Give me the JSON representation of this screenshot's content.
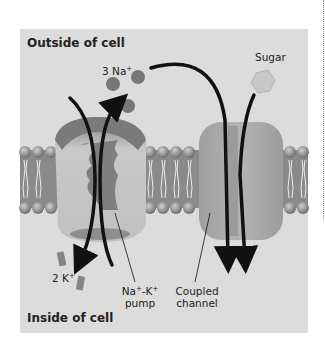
{
  "diagram": {
    "regions": {
      "outside": "Outside of cell",
      "inside": "Inside of cell"
    },
    "ions": {
      "sodium": {
        "count": "3",
        "symbol": "Na",
        "charge": "+"
      },
      "potassium": {
        "count": "2",
        "symbol": "K",
        "charge": "+"
      }
    },
    "molecules": {
      "sugar": "Sugar"
    },
    "proteins": {
      "pump": {
        "line1_a": "Na",
        "line1_charge_a": "+",
        "line1_sep": "-K",
        "line1_charge_b": "+",
        "line2": "pump"
      },
      "channel": {
        "line1": "Coupled",
        "line2": "channel"
      }
    },
    "colors": {
      "background": "#dcdcdc",
      "membrane": "#8c8c8c",
      "pump": "#b5b5b5",
      "channel": "#a9a9a9",
      "ion": "#7a7a7a",
      "arrow": "#111111"
    }
  }
}
